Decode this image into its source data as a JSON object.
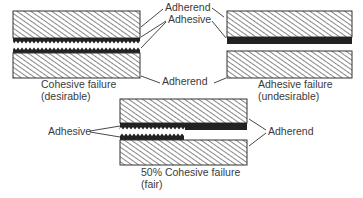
{
  "figure": {
    "panels": [
      {
        "id": "cohesive",
        "caption_line1": "Cohesive failure",
        "caption_line2": "(desirable)"
      },
      {
        "id": "adhesive",
        "caption_line1": "Adhesive failure",
        "caption_line2": "(undesirable)"
      },
      {
        "id": "mixed",
        "caption_line1": "50% Cohesive failure",
        "caption_line2": "(fair)"
      }
    ],
    "labels": {
      "adherend_top": "Adherend",
      "adhesive_top": "Adhesive",
      "adherend_middle": "Adherend",
      "adhesive_bottom": "Adhesive",
      "adherend_bottom": "Adherend"
    }
  },
  "colors": {
    "ink": "#333333",
    "adhesive": "#222222",
    "background": "#ffffff"
  }
}
